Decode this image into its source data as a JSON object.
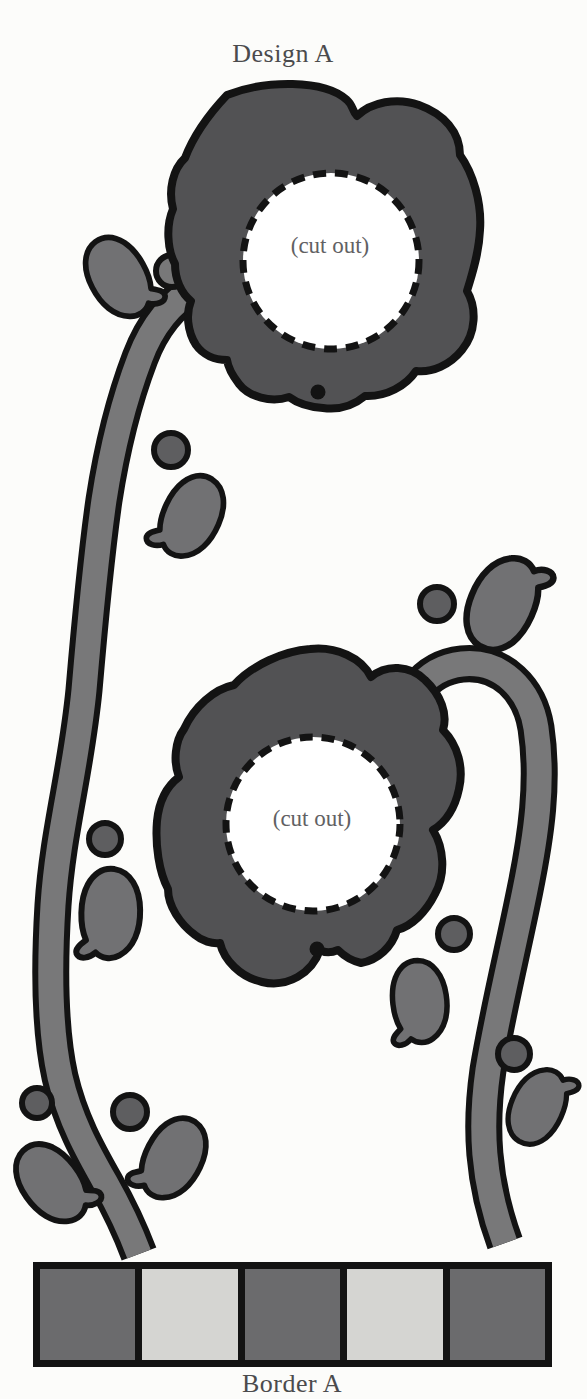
{
  "labels": {
    "design_title": "Design A",
    "border_title": "Border A"
  },
  "flowers": [
    {
      "cutout_label": "(cut out)"
    },
    {
      "cutout_label": "(cut out)"
    }
  ],
  "border": {
    "segments": [
      "dark",
      "light",
      "dark",
      "light",
      "dark"
    ]
  },
  "colors": {
    "paper": "#fcfcfa",
    "outline": "#131313",
    "flower": "#525254",
    "stem": "#787879",
    "leaf": "#717173",
    "berry": "#5e5e60",
    "border_dark": "#6b6b6d",
    "border_light": "#d5d5d2",
    "cutout_fill": "#ffffff",
    "title_text": "#4b4b4d",
    "cutout_text": "#616163"
  }
}
